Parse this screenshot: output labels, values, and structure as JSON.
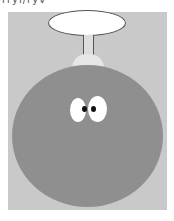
{
  "caption": "rryi/ryv",
  "colors": {
    "panel": "#c9c9c9",
    "body": "#8f8f8f",
    "ellipse": "#ffffff",
    "outline": "#555555",
    "eye": "#ffffff",
    "pupil": "#111111"
  },
  "figure": {
    "parts": [
      "speech-bubble",
      "fuse-stem",
      "fuse-cap",
      "bomb-body",
      "left-eye",
      "right-eye"
    ]
  }
}
